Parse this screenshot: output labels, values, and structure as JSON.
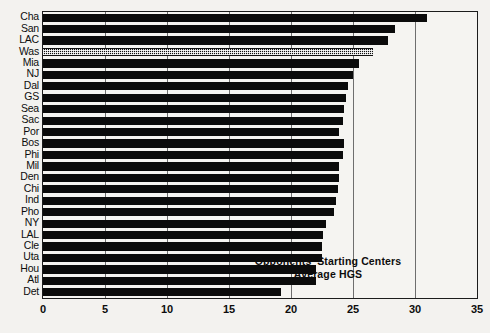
{
  "chart_data": {
    "type": "bar",
    "orientation": "horizontal",
    "title": "",
    "xlabel": "",
    "ylabel": "",
    "xlim": [
      0,
      35
    ],
    "xticks": [
      0,
      5,
      10,
      15,
      20,
      25,
      30,
      35
    ],
    "grid": true,
    "legend": "none",
    "annotations": [
      "Opponents' Starting Centers",
      "Average HGS"
    ],
    "highlight": {
      "category": "Was",
      "style": "hatched-gray"
    },
    "categories": [
      "Cha",
      "San",
      "LAC",
      "Was",
      "Mia",
      "NJ",
      "Dal",
      "GS",
      "Sea",
      "Sac",
      "Por",
      "Bos",
      "Phi",
      "Mil",
      "Den",
      "Chi",
      "Ind",
      "Pho",
      "NY",
      "LAL",
      "Cle",
      "Uta",
      "Hou",
      "Atl",
      "Det"
    ],
    "values": [
      31.0,
      28.4,
      27.8,
      26.6,
      25.5,
      25.0,
      24.6,
      24.4,
      24.3,
      24.2,
      23.9,
      24.3,
      24.2,
      23.9,
      23.9,
      23.8,
      23.6,
      23.5,
      22.8,
      22.6,
      22.5,
      22.5,
      22.0,
      22.0,
      19.2
    ],
    "colors": {
      "bar": "#0b0b0b",
      "highlight_bar": "#808080",
      "axis": "#1c1c1c",
      "grid": "#6e6e6e",
      "background": "#f3f2ef",
      "text": "#0d0d0d"
    }
  }
}
